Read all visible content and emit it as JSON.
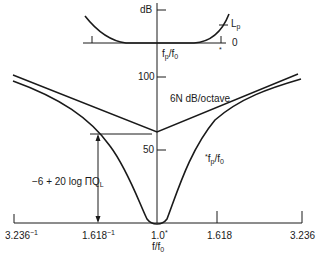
{
  "inset": {
    "y_label": "dB",
    "lp_label": "L",
    "lp_sub": "p",
    "zero_label": "0",
    "x_label": "f",
    "x_label_sub1": "p",
    "x_label_mid": "/f",
    "x_label_sub2": "0",
    "star": "*"
  },
  "main": {
    "tick_100": "100",
    "tick_50": "50",
    "slope_label": "6N dB/octave",
    "curve_label_star": "*",
    "curve_label": "f",
    "curve_label_sub1": "p",
    "curve_label_mid": "/f",
    "curve_label_sub2": "0",
    "depth_label": "−6 + 20 log ΠQ",
    "depth_label_sub": "L",
    "x_ticks": [
      {
        "base": "3.236",
        "sup": "−1"
      },
      {
        "base": "1.618",
        "sup": "−1"
      },
      {
        "base": "1.0",
        "sup": "*"
      },
      {
        "base": "1.618",
        "sup": ""
      },
      {
        "base": "3.236",
        "sup": ""
      }
    ],
    "x_axis_label": "f",
    "x_axis_label_mid": "/f",
    "x_axis_label_sub": "0"
  },
  "colors": {
    "line": "#1a1a1a",
    "background": "#ffffff"
  }
}
